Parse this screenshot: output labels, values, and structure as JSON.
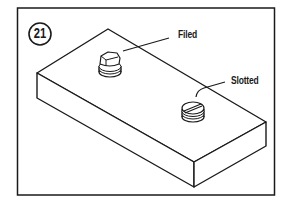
{
  "figure": {
    "number": "21",
    "labels": {
      "filed": "Filed",
      "slotted": "Slotted"
    },
    "colors": {
      "line": "#1a1a1a",
      "background": "#ffffff"
    }
  }
}
